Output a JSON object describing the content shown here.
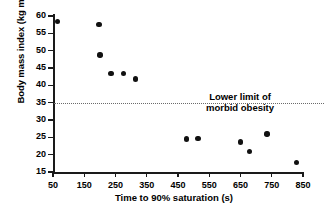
{
  "chart_data": {
    "type": "scatter",
    "title": "",
    "xlabel": "Time to 90% saturation (s)",
    "ylabel": "Body mass index (kg m−2)",
    "ylabel_main": "Body mass index (kg m",
    "ylabel_sup": "−2",
    "ylabel_tail": ")",
    "xlim": [
      50,
      850
    ],
    "ylim": [
      15,
      60
    ],
    "grid": false,
    "legend": null,
    "xticks": [
      50,
      150,
      250,
      350,
      450,
      550,
      650,
      750,
      850
    ],
    "yticks": [
      15,
      20,
      25,
      30,
      35,
      40,
      45,
      50,
      55,
      60
    ],
    "x": [
      65,
      197,
      200,
      236,
      275,
      314,
      478,
      514,
      650,
      678,
      735,
      830
    ],
    "y": [
      58.5,
      57.5,
      48.7,
      43.5,
      43.5,
      41.8,
      24.5,
      24.6,
      23.6,
      20.9,
      26.0,
      17.8
    ],
    "points": [
      {
        "x": 65,
        "y": 58.5
      },
      {
        "x": 197,
        "y": 57.5
      },
      {
        "x": 200,
        "y": 48.7
      },
      {
        "x": 236,
        "y": 43.5
      },
      {
        "x": 275,
        "y": 43.5
      },
      {
        "x": 314,
        "y": 41.8
      },
      {
        "x": 478,
        "y": 24.5
      },
      {
        "x": 514,
        "y": 24.6
      },
      {
        "x": 650,
        "y": 23.6
      },
      {
        "x": 678,
        "y": 20.9
      },
      {
        "x": 735,
        "y": 26.0
      },
      {
        "x": 830,
        "y": 17.8
      }
    ],
    "annotations": [
      {
        "name": "morbid-obesity-threshold",
        "type": "hline",
        "value": 35,
        "style": "dotted",
        "color": "#6b6b6b",
        "label_line1": "Lower limit of",
        "label_line2": "morbid obesity"
      }
    ],
    "marker": {
      "shape": "circle",
      "color": "#111111",
      "size": 5.4
    },
    "axis_color": "#1a1a1a",
    "background": "#ffffff"
  }
}
